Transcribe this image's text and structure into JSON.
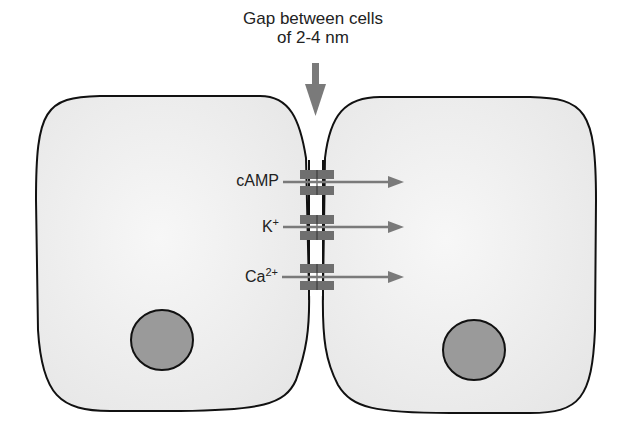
{
  "title": {
    "line1": "Gap between cells",
    "line2": "of 2-4 nm"
  },
  "channels": [
    {
      "label": "cAMP",
      "base": "cAMP",
      "sup": ""
    },
    {
      "label": "K+",
      "base": "K",
      "sup": "+"
    },
    {
      "label": "Ca2+",
      "base": "Ca",
      "sup": "2+"
    }
  ],
  "colors": {
    "cell_fill": "#ececec",
    "cell_stroke": "#111111",
    "nucleus_fill": "#9a9a9a",
    "channel_fill": "#6f6f6f",
    "arrow": "#7a7a7a"
  }
}
